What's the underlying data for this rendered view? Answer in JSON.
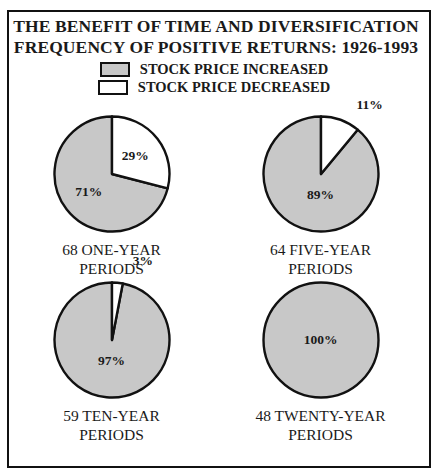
{
  "frame": {
    "border_color": "#111111"
  },
  "title": {
    "line1": "THE BENEFIT OF TIME AND DIVERSIFICATION",
    "line2": "FREQUENCY OF POSITIVE RETURNS: 1926-1993"
  },
  "legend": {
    "items": [
      {
        "label": "STOCK PRICE INCREASED",
        "color": "#c8c8c8",
        "swatch_name": "increased-swatch"
      },
      {
        "label": "STOCK PRICE DECREASED",
        "color": "#ffffff",
        "swatch_name": "decreased-swatch"
      }
    ]
  },
  "colors": {
    "increased": "#c8c8c8",
    "decreased": "#ffffff",
    "outline": "#111111",
    "text": "#1a1a1a"
  },
  "chart_data": {
    "type": "pie",
    "legend_position": "top-center",
    "series_names": [
      "STOCK PRICE INCREASED",
      "STOCK PRICE DECREASED"
    ],
    "charts": [
      {
        "caption_line1": "68 ONE-YEAR",
        "caption_line2": "PERIODS",
        "period_count": 68,
        "period_type": "ONE-YEAR",
        "slices": [
          {
            "name": "STOCK PRICE INCREASED",
            "value": 71,
            "label": "71%"
          },
          {
            "name": "STOCK PRICE DECREASED",
            "value": 29,
            "label": "29%"
          }
        ]
      },
      {
        "caption_line1": "64 FIVE-YEAR",
        "caption_line2": "PERIODS",
        "period_count": 64,
        "period_type": "FIVE-YEAR",
        "slices": [
          {
            "name": "STOCK PRICE INCREASED",
            "value": 89,
            "label": "89%"
          },
          {
            "name": "STOCK PRICE DECREASED",
            "value": 11,
            "label": "11%"
          }
        ]
      },
      {
        "caption_line1": "59 TEN-YEAR",
        "caption_line2": "PERIODS",
        "period_count": 59,
        "period_type": "TEN-YEAR",
        "slices": [
          {
            "name": "STOCK PRICE INCREASED",
            "value": 97,
            "label": "97%"
          },
          {
            "name": "STOCK PRICE DECREASED",
            "value": 3,
            "label": "3%"
          }
        ]
      },
      {
        "caption_line1": "48 TWENTY-YEAR",
        "caption_line2": "PERIODS",
        "period_count": 48,
        "period_type": "TWENTY-YEAR",
        "slices": [
          {
            "name": "STOCK PRICE INCREASED",
            "value": 100,
            "label": "100%"
          },
          {
            "name": "STOCK PRICE DECREASED",
            "value": 0,
            "label": ""
          }
        ]
      }
    ]
  }
}
